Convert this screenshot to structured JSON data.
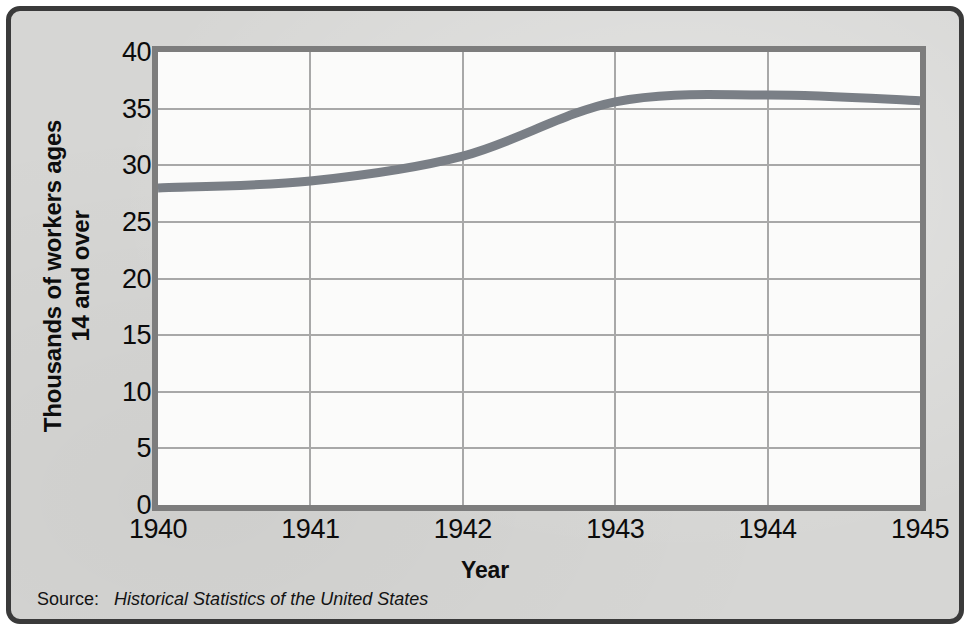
{
  "chart_data": {
    "type": "line",
    "title": "",
    "xlabel": "Year",
    "ylabel": "Thousands of workers ages 14 and over",
    "ylabel_lines": [
      "Thousands of workers ages",
      "14 and over"
    ],
    "x": [
      1940,
      1941,
      1942,
      1943,
      1944,
      1945
    ],
    "xtick_labels": [
      "1940",
      "1941",
      "1942",
      "1943",
      "1944",
      "1945"
    ],
    "ytick_labels": [
      "0",
      "5",
      "10",
      "15",
      "20",
      "25",
      "30",
      "35",
      "40"
    ],
    "yticks": [
      0,
      5,
      10,
      15,
      20,
      25,
      30,
      35,
      40
    ],
    "values": [
      28.0,
      28.6,
      30.8,
      35.6,
      36.2,
      35.7
    ],
    "series": [
      {
        "name": "Thousands of workers ages 14 and over",
        "values": [
          28.0,
          28.6,
          30.8,
          35.6,
          36.2,
          35.7
        ]
      }
    ],
    "xlim": [
      1940,
      1945
    ],
    "ylim": [
      0,
      40
    ],
    "grid": true,
    "legend": "none",
    "line_color": "#7a7f86",
    "grid_color": "#a8a8a8",
    "plot_background": "#fbfbfa",
    "figure_background": "#d6d6d4",
    "border_color": "#3a3a3a",
    "axis_color": "#7d7d7d"
  },
  "source": {
    "label": "Source:",
    "title": "Historical Statistics of the United States"
  }
}
